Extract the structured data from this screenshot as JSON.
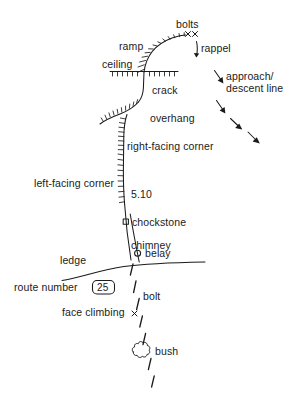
{
  "diagram": {
    "type": "climbing-topo-legend",
    "background_color": "#ffffff",
    "ink_color": "#1a1a1a",
    "width": 297,
    "height": 407
  },
  "labels": {
    "bolts": "bolts",
    "ramp": "ramp",
    "rappel": "rappel",
    "ceiling": "ceiling",
    "crack": "crack",
    "approach_descent": "approach/\ndescent line",
    "overhang": "overhang",
    "right_facing_corner": "right-facing corner",
    "left_facing_corner": "left-facing corner",
    "grade": "5.10",
    "chockstone": "chockstone",
    "chimney": "chimney",
    "belay": "belay",
    "ledge": "ledge",
    "route_number": "route number",
    "route_number_value": "25",
    "bolt": "bolt",
    "face_climbing": "face climbing",
    "bush": "bush"
  },
  "symbols": {
    "bolts_mark": "xx",
    "bolt_mark": "x",
    "face_climbing_mark": "x",
    "belay_mark": "circle",
    "chockstone_mark": "square",
    "bush_mark": "cloud",
    "rappel_mark": "down-arrow",
    "approach_mark": "diagonal-arrows"
  }
}
